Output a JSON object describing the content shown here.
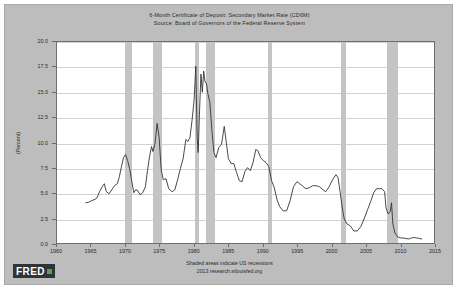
{
  "chart_data": {
    "type": "line",
    "title": "6-Month Certificate of Deposit: Secondary Market Rate (CD6M)",
    "subtitle": "Source: Board of Governors of the Federal Reserve System",
    "xlabel": "",
    "ylabel": "(Percent)",
    "ylim": [
      0.0,
      20.0
    ],
    "xlim": [
      1960,
      2015
    ],
    "grid": true,
    "legend": "none",
    "y_ticks": [
      "0.0",
      "2.5",
      "5.0",
      "7.5",
      "10.0",
      "12.5",
      "15.0",
      "17.5",
      "20.0"
    ],
    "y_tick_values": [
      0.0,
      2.5,
      5.0,
      7.5,
      10.0,
      12.5,
      15.0,
      17.5,
      20.0
    ],
    "x_ticks": [
      "1960",
      "1965",
      "1970",
      "1975",
      "1980",
      "1985",
      "1990",
      "1995",
      "2000",
      "2005",
      "2010",
      "2015"
    ],
    "x_tick_values": [
      1960,
      1965,
      1970,
      1975,
      1980,
      1985,
      1990,
      1995,
      2000,
      2005,
      2010,
      2015
    ],
    "line_color": "#333333",
    "recession_band_color": "#c4c4c4",
    "plot_background": "#ffffff",
    "figure_background": "#bdbdbd",
    "recessions": [
      {
        "start": 1969.92,
        "end": 1970.92
      },
      {
        "start": 1973.92,
        "end": 1975.25
      },
      {
        "start": 1980.08,
        "end": 1980.58
      },
      {
        "start": 1981.58,
        "end": 1982.92
      },
      {
        "start": 1990.58,
        "end": 1991.25
      },
      {
        "start": 2001.25,
        "end": 2001.92
      },
      {
        "start": 2007.92,
        "end": 2009.5
      }
    ],
    "series": [
      {
        "name": "6-Month Certificate of Deposit: Secondary Market Rate (CD6M)",
        "x": [
          1964.2,
          1964.6,
          1965.0,
          1965.4,
          1965.8,
          1966.2,
          1966.6,
          1966.9,
          1967.2,
          1967.6,
          1968.0,
          1968.4,
          1968.8,
          1969.1,
          1969.4,
          1969.7,
          1970.0,
          1970.3,
          1970.6,
          1970.9,
          1971.2,
          1971.5,
          1971.8,
          1972.1,
          1972.5,
          1972.9,
          1973.2,
          1973.5,
          1973.8,
          1974.0,
          1974.3,
          1974.6,
          1974.9,
          1975.2,
          1975.5,
          1975.9,
          1976.3,
          1976.8,
          1977.2,
          1977.6,
          1978.0,
          1978.4,
          1978.8,
          1979.1,
          1979.4,
          1979.7,
          1980.0,
          1980.25,
          1980.45,
          1980.6,
          1980.8,
          1981.0,
          1981.2,
          1981.4,
          1981.6,
          1981.8,
          1982.0,
          1982.3,
          1982.6,
          1982.9,
          1983.2,
          1983.6,
          1984.0,
          1984.4,
          1984.7,
          1985.0,
          1985.4,
          1985.8,
          1986.2,
          1986.6,
          1987.0,
          1987.4,
          1987.8,
          1988.2,
          1988.6,
          1989.0,
          1989.3,
          1989.7,
          1990.1,
          1990.5,
          1990.9,
          1991.3,
          1991.7,
          1992.1,
          1992.5,
          1993.0,
          1993.5,
          1994.0,
          1994.5,
          1995.0,
          1995.4,
          1995.8,
          1996.3,
          1996.8,
          1997.3,
          1997.8,
          1998.3,
          1998.8,
          1999.2,
          1999.7,
          2000.2,
          2000.7,
          2001.0,
          2001.3,
          2001.6,
          2001.9,
          2002.3,
          2002.8,
          2003.3,
          2003.8,
          2004.3,
          2004.8,
          2005.3,
          2005.8,
          2006.2,
          2006.6,
          2007.0,
          2007.4,
          2007.8,
          2008.0,
          2008.3,
          2008.6,
          2008.8,
          2009.0,
          2009.3,
          2009.7,
          2010.1,
          2010.5,
          2010.9,
          2011.3,
          2011.7,
          2012.1,
          2012.5,
          2012.9,
          2013.2
        ],
        "y": [
          4.0,
          4.05,
          4.2,
          4.3,
          4.45,
          5.1,
          5.6,
          5.9,
          5.1,
          4.9,
          5.3,
          5.7,
          5.9,
          6.6,
          7.6,
          8.5,
          8.8,
          8.2,
          7.4,
          6.2,
          5.0,
          5.3,
          5.2,
          4.8,
          5.0,
          5.6,
          7.2,
          8.6,
          9.6,
          9.1,
          9.9,
          11.9,
          10.5,
          7.3,
          6.3,
          6.4,
          5.4,
          5.1,
          5.3,
          6.3,
          7.4,
          8.4,
          10.3,
          10.1,
          10.5,
          12.2,
          14.2,
          17.6,
          10.5,
          9.0,
          13.2,
          16.8,
          15.0,
          17.1,
          16.0,
          15.9,
          14.9,
          14.0,
          11.2,
          9.0,
          8.5,
          9.5,
          9.8,
          11.6,
          10.0,
          8.4,
          7.9,
          7.9,
          7.0,
          6.2,
          6.1,
          7.1,
          7.5,
          7.2,
          8.0,
          9.3,
          9.2,
          8.5,
          8.2,
          8.0,
          7.6,
          6.2,
          5.5,
          4.3,
          3.6,
          3.2,
          3.2,
          4.2,
          5.6,
          6.1,
          5.9,
          5.7,
          5.4,
          5.5,
          5.7,
          5.7,
          5.6,
          5.3,
          5.1,
          5.6,
          6.3,
          6.8,
          6.5,
          5.1,
          3.6,
          2.4,
          1.9,
          1.7,
          1.2,
          1.2,
          1.6,
          2.4,
          3.3,
          4.2,
          5.0,
          5.4,
          5.4,
          5.4,
          5.1,
          3.5,
          2.9,
          3.1,
          4.0,
          1.9,
          1.0,
          0.6,
          0.5,
          0.5,
          0.45,
          0.4,
          0.5,
          0.55,
          0.5,
          0.45,
          0.4
        ]
      }
    ],
    "annotations": [
      "Shaded areas indicate US recessions",
      "2013 research.stlouisfed.org"
    ]
  },
  "footer": {
    "recession_note": "Shaded areas indicate US recessions",
    "source_note": "2013 research.stlouisfed.org"
  },
  "logo": {
    "text": "FRED",
    "mark_color": "#5f9e4f"
  }
}
